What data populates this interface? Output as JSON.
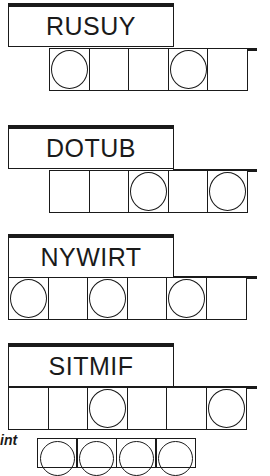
{
  "puzzles": [
    {
      "scrambled": "RUSUY",
      "cells": 5,
      "circled": [
        0,
        3
      ]
    },
    {
      "scrambled": "DOTUB",
      "cells": 5,
      "circled": [
        2,
        4
      ]
    },
    {
      "scrambled": "NYWIRT",
      "cells": 6,
      "circled": [
        0,
        2,
        4
      ]
    },
    {
      "scrambled": "SITMIF",
      "cells": 6,
      "circled": [
        2,
        5
      ]
    }
  ],
  "hint_label": "int",
  "answer_cells": 4
}
